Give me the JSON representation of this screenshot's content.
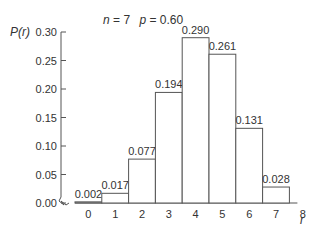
{
  "chart_data": {
    "type": "bar",
    "title": "n = 7  p = 0.60",
    "title_parts": {
      "n_label": "n",
      "n_value": "7",
      "p_label": "p",
      "p_value": "0.60"
    },
    "xlabel": "r",
    "ylabel": "P(r)",
    "categories": [
      "0",
      "1",
      "2",
      "3",
      "4",
      "5",
      "6",
      "7"
    ],
    "values": [
      0.002,
      0.017,
      0.077,
      0.194,
      0.29,
      0.261,
      0.131,
      0.028
    ],
    "value_labels": [
      "0.002",
      "0.017",
      "0.077",
      "0.194",
      "0.290",
      "0.261",
      "0.131",
      "0.028"
    ],
    "x_ticks": [
      "0",
      "1",
      "2",
      "3",
      "4",
      "5",
      "6",
      "7",
      "8"
    ],
    "y_ticks": [
      "0.00",
      "0.05",
      "0.10",
      "0.15",
      "0.20",
      "0.25",
      "0.30"
    ],
    "ylim": [
      0,
      0.3
    ],
    "grid": false,
    "legend": null,
    "annotations": [
      "axis break symbol on x-axis near origin"
    ]
  }
}
